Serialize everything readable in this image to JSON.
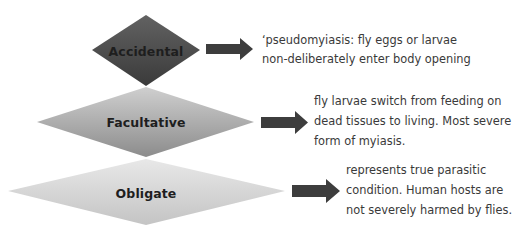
{
  "diagram": {
    "type": "myiasis-classification",
    "items": [
      {
        "label": "Accidental",
        "description_lines": [
          "‘pseudomyiasis: fly eggs or larvae",
          "non-deliberately enter body opening"
        ],
        "fill_top": "#5e5e5e",
        "fill_bottom": "#3a3a3a"
      },
      {
        "label": "Facultative",
        "description_lines": [
          "fly larvae switch from feeding on",
          "dead tissues to living. Most severe",
          "form of myiasis."
        ],
        "fill_top": "#c4c4c4",
        "fill_bottom": "#8e8e8e"
      },
      {
        "label": "Obligate",
        "description_lines": [
          "represents true parasitic",
          "condition. Human hosts are",
          "not severely harmed by flies."
        ],
        "fill_top": "#e2e2e2",
        "fill_bottom": "#c6c6c6"
      }
    ],
    "arrow_color": "#3d3d3d",
    "arrow_icon": "right-arrow-icon"
  }
}
